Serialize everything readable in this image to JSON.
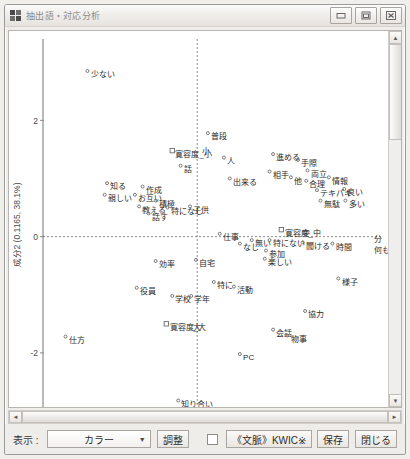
{
  "window": {
    "title": "抽出語・対応分析",
    "icon": "app-grid-icon",
    "controls": {
      "minimize": "minimize-icon",
      "maximize": "maximize-icon",
      "close": "close-icon"
    }
  },
  "toolbar": {
    "display_label": "表示 :",
    "color_select_value": "カラー",
    "adjust_label": "調整",
    "kwic_checkbox_checked": false,
    "kwic_label": "《文脈》KWIC※",
    "save_label": "保存",
    "close_label": "閉じる"
  },
  "scrollbars": {
    "up_arrow": "▲",
    "down_arrow": "▼",
    "left_arrow": "◄",
    "right_arrow": "►"
  },
  "chart_data": {
    "type": "scatter",
    "title": "",
    "xlabel": "",
    "ylabel": "成分2 (0.1165, 38.1%)",
    "xlim": [
      -2.6,
      3.1
    ],
    "ylim": [
      -3.0,
      3.4
    ],
    "grid": false,
    "origin_lines": true,
    "yticks": [
      2,
      0,
      -2
    ],
    "ytick_labels": [
      "2",
      "0",
      "-2"
    ],
    "xticks": [],
    "xtick_labels": [],
    "points": [
      {
        "label": "少ない",
        "x": -1.85,
        "y": 2.85,
        "marker": "circle"
      },
      {
        "label": "普段",
        "x": 0.18,
        "y": 1.78,
        "marker": "circle"
      },
      {
        "label": "寛容度_小",
        "x": -0.42,
        "y": 1.48,
        "marker": "square"
      },
      {
        "label": "小",
        "x": 0.02,
        "y": 1.52,
        "marker": "none"
      },
      {
        "label": "話",
        "x": -0.28,
        "y": 1.22,
        "marker": "circle"
      },
      {
        "label": "人",
        "x": 0.45,
        "y": 1.36,
        "marker": "circle"
      },
      {
        "label": "出来る",
        "x": 0.55,
        "y": 1.0,
        "marker": "circle"
      },
      {
        "label": "進める",
        "x": 1.28,
        "y": 1.42,
        "marker": "circle"
      },
      {
        "label": "手際",
        "x": 1.7,
        "y": 1.32,
        "marker": "circle"
      },
      {
        "label": "相手",
        "x": 1.22,
        "y": 1.12,
        "marker": "circle"
      },
      {
        "label": "他",
        "x": 1.58,
        "y": 1.02,
        "marker": "circle"
      },
      {
        "label": "両立",
        "x": 1.86,
        "y": 1.14,
        "marker": "circle"
      },
      {
        "label": "合理",
        "x": 1.84,
        "y": 0.96,
        "marker": "circle"
      },
      {
        "label": "情報",
        "x": 2.22,
        "y": 1.02,
        "marker": "circle"
      },
      {
        "label": "テキパキ",
        "x": 2.02,
        "y": 0.8,
        "marker": "circle"
      },
      {
        "label": "良い",
        "x": 2.48,
        "y": 0.82,
        "marker": "circle"
      },
      {
        "label": "無駄",
        "x": 2.08,
        "y": 0.62,
        "marker": "circle"
      },
      {
        "label": "多い",
        "x": 2.5,
        "y": 0.62,
        "marker": "circle"
      },
      {
        "label": "知る",
        "x": -1.52,
        "y": 0.92,
        "marker": "circle"
      },
      {
        "label": "親しい",
        "x": -1.56,
        "y": 0.72,
        "marker": "circle"
      },
      {
        "label": "作成",
        "x": -0.92,
        "y": 0.86,
        "marker": "circle"
      },
      {
        "label": "お互い",
        "x": -1.05,
        "y": 0.72,
        "marker": "circle"
      },
      {
        "label": "積極",
        "x": -0.7,
        "y": 0.62,
        "marker": "circle"
      },
      {
        "label": "教える",
        "x": -0.98,
        "y": 0.52,
        "marker": "circle"
      },
      {
        "label": "特になし",
        "x": -0.5,
        "y": 0.5,
        "marker": "circle"
      },
      {
        "label": "話す",
        "x": -0.82,
        "y": 0.4,
        "marker": "circle"
      },
      {
        "label": "子供",
        "x": -0.12,
        "y": 0.52,
        "marker": "circle"
      },
      {
        "label": "仕事",
        "x": 0.38,
        "y": 0.05,
        "marker": "circle"
      },
      {
        "label": "寛容度_中",
        "x": 1.42,
        "y": 0.12,
        "marker": "square"
      },
      {
        "label": "中",
        "x": 1.72,
        "y": 0.12,
        "marker": "none"
      },
      {
        "label": "なし",
        "x": 0.72,
        "y": -0.12,
        "marker": "circle"
      },
      {
        "label": "無い",
        "x": 0.92,
        "y": -0.06,
        "marker": "circle"
      },
      {
        "label": "特にない",
        "x": 1.22,
        "y": -0.06,
        "marker": "circle"
      },
      {
        "label": "聞ける",
        "x": 1.78,
        "y": -0.1,
        "marker": "circle"
      },
      {
        "label": "時間",
        "x": 2.28,
        "y": -0.12,
        "marker": "circle"
      },
      {
        "label": "分",
        "x": 2.92,
        "y": 0.02,
        "marker": "none"
      },
      {
        "label": "何もなかった",
        "x": 2.92,
        "y": -0.18,
        "marker": "none"
      },
      {
        "label": "参加",
        "x": 1.16,
        "y": -0.24,
        "marker": "circle"
      },
      {
        "label": "楽しい",
        "x": 1.14,
        "y": -0.38,
        "marker": "circle"
      },
      {
        "label": "効率",
        "x": -0.7,
        "y": -0.42,
        "marker": "circle"
      },
      {
        "label": "自宅",
        "x": -0.02,
        "y": -0.4,
        "marker": "circle"
      },
      {
        "label": "様子",
        "x": 2.38,
        "y": -0.72,
        "marker": "circle"
      },
      {
        "label": "役員",
        "x": -1.02,
        "y": -0.88,
        "marker": "circle"
      },
      {
        "label": "活動",
        "x": 0.62,
        "y": -0.86,
        "marker": "circle"
      },
      {
        "label": "特に",
        "x": 0.28,
        "y": -0.78,
        "marker": "circle"
      },
      {
        "label": "学校",
        "x": -0.42,
        "y": -1.02,
        "marker": "circle"
      },
      {
        "label": "学年",
        "x": -0.1,
        "y": -1.02,
        "marker": "circle"
      },
      {
        "label": "協力",
        "x": 1.82,
        "y": -1.28,
        "marker": "circle"
      },
      {
        "label": "寛容度_大",
        "x": -0.52,
        "y": -1.5,
        "marker": "square"
      },
      {
        "label": "大",
        "x": -0.12,
        "y": -1.5,
        "marker": "none"
      },
      {
        "label": "会話",
        "x": 1.28,
        "y": -1.6,
        "marker": "circle"
      },
      {
        "label": "物事",
        "x": 1.52,
        "y": -1.7,
        "marker": "circle"
      },
      {
        "label": "仕方",
        "x": -2.22,
        "y": -1.72,
        "marker": "circle"
      },
      {
        "label": "PC",
        "x": 0.72,
        "y": -2.02,
        "marker": "circle"
      },
      {
        "label": "知り合い",
        "x": -0.32,
        "y": -2.82,
        "marker": "circle"
      }
    ]
  }
}
